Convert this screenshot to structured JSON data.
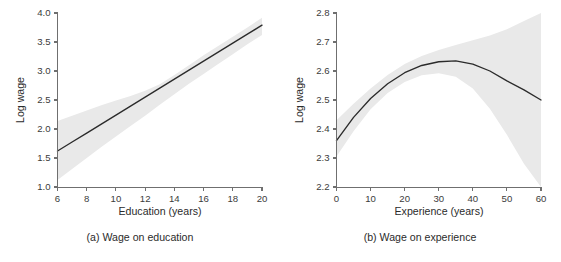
{
  "figure": {
    "panels": [
      {
        "id": "panel-a",
        "caption": "(a) Wage on education",
        "chart_index": 0
      },
      {
        "id": "panel-b",
        "caption": "(b) Wage on experience",
        "chart_index": 1
      }
    ]
  },
  "chart_data": [
    {
      "type": "line",
      "title": "(a) Wage on education",
      "xlabel": "Education (years)",
      "ylabel": "Log wage",
      "xlim": [
        6,
        20
      ],
      "ylim": [
        1.0,
        4.0
      ],
      "xticks": [
        6,
        8,
        10,
        12,
        14,
        16,
        18,
        20
      ],
      "xticklabels": [
        "6",
        "8",
        "10",
        "12",
        "14",
        "16",
        "18",
        "20"
      ],
      "yticks": [
        1.0,
        1.5,
        2.0,
        2.5,
        3.0,
        3.5,
        4.0
      ],
      "yticklabels": [
        "1.0",
        "1.5",
        "2.0",
        "2.5",
        "3.0",
        "3.5",
        "4.0"
      ],
      "grid": false,
      "legend": null,
      "band_style": {
        "fill": "#e9e9e9",
        "label": "confidence band"
      },
      "line_style": {
        "stroke": "#2b2b2b",
        "width": 1.35
      },
      "x": [
        6,
        7,
        8,
        9,
        10,
        11,
        12,
        13,
        14,
        15,
        16,
        17,
        18,
        19,
        20
      ],
      "series": [
        {
          "name": "fitted log wage",
          "values": [
            1.62,
            1.775,
            1.93,
            2.085,
            2.24,
            2.395,
            2.55,
            2.705,
            2.86,
            3.015,
            3.17,
            3.325,
            3.48,
            3.635,
            3.79
          ]
        },
        {
          "name": "upper confidence bound",
          "values": [
            2.14,
            2.23,
            2.32,
            2.41,
            2.49,
            2.57,
            2.66,
            2.77,
            2.93,
            3.1,
            3.27,
            3.43,
            3.59,
            3.75,
            3.92
          ]
        },
        {
          "name": "lower confidence bound",
          "values": [
            1.12,
            1.31,
            1.5,
            1.69,
            1.87,
            2.05,
            2.23,
            2.42,
            2.6,
            2.78,
            2.95,
            3.12,
            3.29,
            3.46,
            3.62
          ]
        }
      ]
    },
    {
      "type": "line",
      "title": "(b) Wage on experience",
      "xlabel": "Experience (years)",
      "ylabel": "Log wage",
      "xlim": [
        0,
        60
      ],
      "ylim": [
        2.2,
        2.8
      ],
      "xticks": [
        0,
        10,
        20,
        30,
        40,
        50,
        60
      ],
      "xticklabels": [
        "0",
        "10",
        "20",
        "30",
        "40",
        "50",
        "60"
      ],
      "yticks": [
        2.2,
        2.3,
        2.4,
        2.5,
        2.6,
        2.7,
        2.8
      ],
      "yticklabels": [
        "2.2",
        "2.3",
        "2.4",
        "2.5",
        "2.6",
        "2.7",
        "2.8"
      ],
      "grid": false,
      "legend": null,
      "band_style": {
        "fill": "#e9e9e9",
        "label": "confidence band"
      },
      "line_style": {
        "stroke": "#2b2b2b",
        "width": 1.35
      },
      "x": [
        0,
        5,
        10,
        15,
        20,
        25,
        30,
        35,
        40,
        45,
        50,
        55,
        60
      ],
      "series": [
        {
          "name": "fitted log wage",
          "values": [
            2.36,
            2.44,
            2.505,
            2.556,
            2.594,
            2.619,
            2.632,
            2.635,
            2.624,
            2.6,
            2.566,
            2.535,
            2.5
          ]
        },
        {
          "name": "upper confidence bound",
          "values": [
            2.43,
            2.487,
            2.54,
            2.586,
            2.624,
            2.652,
            2.672,
            2.69,
            2.706,
            2.722,
            2.744,
            2.772,
            2.81
          ]
        },
        {
          "name": "lower confidence bound",
          "values": [
            2.305,
            2.392,
            2.468,
            2.524,
            2.562,
            2.585,
            2.592,
            2.58,
            2.54,
            2.47,
            2.38,
            2.28,
            2.18
          ]
        }
      ],
      "annotations": [
        {
          "text": "peak near 35 years of experience",
          "x": 35,
          "y": 2.635
        }
      ]
    }
  ]
}
